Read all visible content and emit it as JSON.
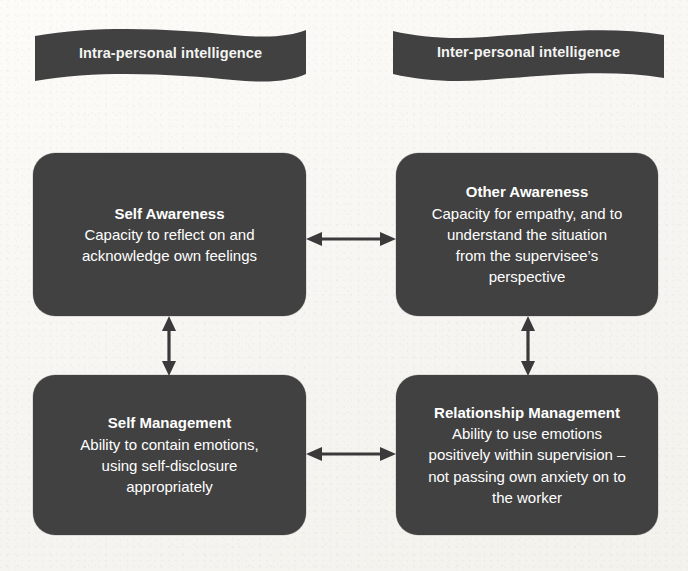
{
  "diagram": {
    "colors": {
      "node_fill": "#414141",
      "node_text": "#ffffff",
      "banner_fill": "#414141",
      "banner_text": "#f4f4f2",
      "arrow": "#3a3a3a",
      "background": "#fbfaf7"
    },
    "banners": [
      {
        "id": "intra-personal",
        "label": "Intra-personal intelligence"
      },
      {
        "id": "inter-personal",
        "label": "Inter-personal intelligence"
      }
    ],
    "nodes": [
      {
        "id": "self-awareness",
        "title": "Self Awareness",
        "description": "Capacity to reflect on and\nacknowledge own feelings"
      },
      {
        "id": "other-awareness",
        "title": "Other Awareness",
        "description": "Capacity for empathy, and to\nunderstand the situation\nfrom the supervisee’s\nperspective"
      },
      {
        "id": "self-management",
        "title": "Self Management",
        "description": "Ability to contain emotions,\nusing self-disclosure\nappropriately"
      },
      {
        "id": "relationship-management",
        "title": "Relationship Management",
        "description": "Ability to use emotions\npositively within supervision –\nnot passing own anxiety on to\nthe worker"
      }
    ],
    "connectors": [
      {
        "id": "self-awareness-to-other-awareness",
        "orientation": "horizontal",
        "style": "double-headed"
      },
      {
        "id": "self-management-to-relationship-management",
        "orientation": "horizontal",
        "style": "double-headed"
      },
      {
        "id": "self-awareness-to-self-management",
        "orientation": "vertical",
        "style": "double-headed"
      },
      {
        "id": "other-awareness-to-relationship-management",
        "orientation": "vertical",
        "style": "double-headed"
      }
    ]
  }
}
